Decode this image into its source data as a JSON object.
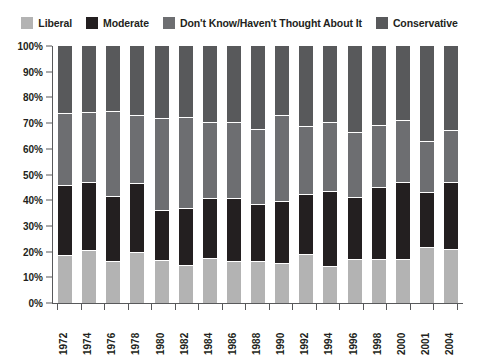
{
  "chart_data": {
    "type": "bar",
    "subtype": "stacked-bar-100-percent",
    "title": "",
    "subtitle": "",
    "xlabel": "",
    "ylabel": "",
    "ylim": [
      0,
      100
    ],
    "ytick_labels": [
      "100%",
      "90%",
      "80%",
      "70%",
      "60%",
      "50%",
      "40%",
      "30%",
      "20%",
      "10%",
      "0%"
    ],
    "ytick_values": [
      100,
      90,
      80,
      70,
      60,
      50,
      40,
      30,
      20,
      10,
      0
    ],
    "grid": false,
    "legend_position": "top",
    "categories": [
      "1972",
      "1974",
      "1976",
      "1978",
      "1980",
      "1982",
      "1984",
      "1986",
      "1988",
      "1990",
      "1992",
      "1994",
      "1996",
      "1998",
      "2000",
      "2001",
      "2004"
    ],
    "series": [
      {
        "name": "Liberal",
        "color": "#b3b3b3",
        "values": [
          18.5,
          20.5,
          16.0,
          19.5,
          16.5,
          14.5,
          17.5,
          16.0,
          16.0,
          15.5,
          19.0,
          14.0,
          17.0,
          17.0,
          17.0,
          21.5,
          21.0
        ]
      },
      {
        "name": "Moderate",
        "color": "#231f20",
        "values": [
          27.0,
          26.5,
          25.5,
          27.0,
          19.5,
          22.0,
          23.0,
          24.5,
          22.0,
          24.0,
          23.0,
          29.5,
          24.0,
          28.0,
          30.0,
          21.5,
          26.0
        ]
      },
      {
        "name": "Don't Know/Haven't Thought About It",
        "color": "#6d6e71",
        "values": [
          28.0,
          27.0,
          33.0,
          26.5,
          35.5,
          35.5,
          29.5,
          29.5,
          29.5,
          33.5,
          26.5,
          26.5,
          25.0,
          24.0,
          24.0,
          19.5,
          20.0
        ]
      },
      {
        "name": "Conservative",
        "color": "#58595b",
        "values": [
          26.5,
          26.0,
          25.5,
          27.0,
          28.5,
          28.0,
          30.0,
          30.0,
          32.5,
          27.0,
          31.5,
          30.0,
          34.0,
          31.0,
          29.0,
          37.5,
          33.0
        ]
      }
    ]
  },
  "legend": {
    "items": [
      {
        "label": "Liberal",
        "color": "#b3b3b3"
      },
      {
        "label": "Moderate",
        "color": "#231f20"
      },
      {
        "label": "Don't Know/Haven't Thought About It",
        "color": "#6d6e71"
      },
      {
        "label": "Conservative",
        "color": "#58595b"
      }
    ]
  },
  "axis": {
    "axis_color": "#58595b",
    "separator_color": "#ffffff"
  }
}
